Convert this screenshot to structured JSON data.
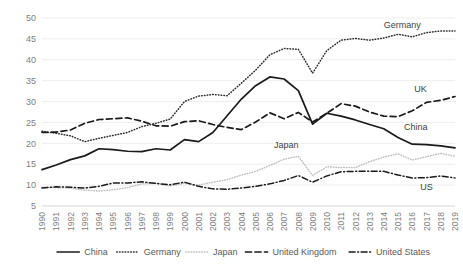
{
  "chart_data": {
    "type": "line",
    "title": "",
    "xlabel": "",
    "ylabel": "",
    "ylim": [
      5,
      50
    ],
    "ytick_step": 5,
    "grid": true,
    "legend_position": "bottom",
    "x": [
      1990,
      1991,
      1992,
      1993,
      1994,
      1995,
      1996,
      1997,
      1998,
      1999,
      2000,
      2001,
      2002,
      2003,
      2004,
      2005,
      2006,
      2007,
      2008,
      2009,
      2010,
      2011,
      2012,
      2013,
      2014,
      2015,
      2016,
      2017,
      2018,
      2019
    ],
    "yticks": [
      5,
      10,
      15,
      20,
      25,
      30,
      35,
      40,
      45,
      50
    ],
    "series": [
      {
        "name": "China",
        "style": "solid",
        "color": "#1a1a1a",
        "inline_label": "China",
        "values": [
          13.7,
          14.8,
          16.1,
          17.0,
          18.7,
          18.5,
          18.1,
          18.0,
          18.7,
          18.4,
          20.9,
          20.4,
          22.6,
          26.6,
          30.6,
          33.8,
          35.9,
          35.4,
          32.6,
          24.6,
          27.2,
          26.5,
          25.6,
          24.5,
          23.5,
          21.4,
          19.8,
          19.7,
          19.4,
          18.9
        ]
      },
      {
        "name": "Germany",
        "style": "dotted",
        "color": "#2b2b2b",
        "inline_label": "Germany",
        "values": [
          22.9,
          22.4,
          21.8,
          20.4,
          21.2,
          21.9,
          22.6,
          24.0,
          24.8,
          25.8,
          30.0,
          31.3,
          31.7,
          31.4,
          34.4,
          37.5,
          41.2,
          42.7,
          42.5,
          36.8,
          42.2,
          44.7,
          45.1,
          44.7,
          45.2,
          46.1,
          45.5,
          46.5,
          46.9,
          46.9
        ]
      },
      {
        "name": "Japan",
        "style": "dotted-light",
        "color": "#c0c0c0",
        "inline_label": "Japan",
        "values": [
          9.5,
          9.4,
          9.3,
          8.8,
          8.6,
          8.9,
          9.4,
          10.3,
          10.4,
          9.8,
          10.4,
          10.0,
          10.7,
          11.3,
          12.4,
          13.3,
          14.7,
          16.2,
          16.9,
          12.3,
          14.4,
          14.2,
          14.2,
          15.6,
          16.7,
          17.5,
          16.0,
          16.8,
          17.6,
          16.9
        ]
      },
      {
        "name": "United Kingdom",
        "style": "dashed",
        "color": "#1a1a1a",
        "inline_label": "UK",
        "values": [
          22.6,
          22.7,
          23.2,
          24.8,
          25.7,
          25.9,
          26.1,
          25.3,
          24.2,
          24.1,
          25.2,
          25.4,
          24.5,
          23.8,
          23.3,
          25.1,
          27.3,
          25.9,
          27.4,
          25.1,
          27.2,
          29.5,
          28.9,
          27.5,
          26.5,
          26.4,
          27.8,
          29.8,
          30.3,
          31.2
        ]
      },
      {
        "name": "United States",
        "style": "dash-dot",
        "color": "#1a1a1a",
        "inline_label": "US",
        "values": [
          9.3,
          9.6,
          9.5,
          9.3,
          9.7,
          10.5,
          10.5,
          10.8,
          10.4,
          10.1,
          10.7,
          9.7,
          9.1,
          9.0,
          9.3,
          9.7,
          10.3,
          11.1,
          12.3,
          10.7,
          12.2,
          13.2,
          13.3,
          13.3,
          13.3,
          12.4,
          11.7,
          11.8,
          12.2,
          11.7
        ]
      }
    ],
    "legend": [
      {
        "label": "China",
        "style": "solid"
      },
      {
        "label": "Germany",
        "style": "dotted"
      },
      {
        "label": "Japan",
        "style": "dotted-light"
      },
      {
        "label": "United Kingdom",
        "style": "dashed"
      },
      {
        "label": "United States",
        "style": "dash-dot"
      }
    ],
    "annotations": [
      {
        "text": "Germany",
        "series": "Germany"
      },
      {
        "text": "UK",
        "series": "United Kingdom"
      },
      {
        "text": "China",
        "series": "China"
      },
      {
        "text": "Japan",
        "series": "Japan"
      },
      {
        "text": "US",
        "series": "United States"
      }
    ]
  },
  "colors": {
    "grid": "#e8e8e8",
    "text": "#808080",
    "line_dark": "#1a1a1a",
    "line_light": "#c0c0c0",
    "background": "#ffffff"
  }
}
